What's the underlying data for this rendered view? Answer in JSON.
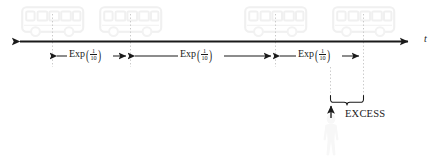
{
  "figure": {
    "type": "timeline-diagram",
    "axis": {
      "variable_label": "t",
      "y": 41,
      "x_start": 12,
      "x_end": 416,
      "color": "#1a1a1a",
      "double_ended": true
    },
    "event_markers": [
      {
        "name": "bus-arrival-1",
        "x": 52,
        "icon": "bus-icon"
      },
      {
        "name": "bus-arrival-2",
        "x": 130,
        "icon": "bus-icon"
      },
      {
        "name": "bus-arrival-3",
        "x": 275,
        "icon": "bus-icon"
      },
      {
        "name": "bus-arrival-4",
        "x": 363,
        "icon": "bus-icon"
      }
    ],
    "intervals": [
      {
        "name": "interval-1",
        "label_fn": "Exp",
        "numerator": "1",
        "denominator": "10",
        "x_start": 52,
        "x_end": 130
      },
      {
        "name": "interval-2",
        "label_fn": "Exp",
        "numerator": "1",
        "denominator": "10",
        "x_start": 130,
        "x_end": 275
      },
      {
        "name": "interval-3",
        "label_fn": "Exp",
        "numerator": "1",
        "denominator": "10",
        "x_start": 275,
        "x_end": 363
      }
    ],
    "annotation": {
      "name": "excess-annotation",
      "label": "EXCESS",
      "brace_x_start": 330,
      "brace_x_end": 363,
      "observer_icon": "person-icon",
      "observer_x": 331
    },
    "colors": {
      "ink": "#1a1a1a",
      "guide_line": "#c9c9c9",
      "icon_outline": "#f1f1f1",
      "icon_shadow": "#f7f7f7",
      "background": "#ffffff"
    }
  }
}
